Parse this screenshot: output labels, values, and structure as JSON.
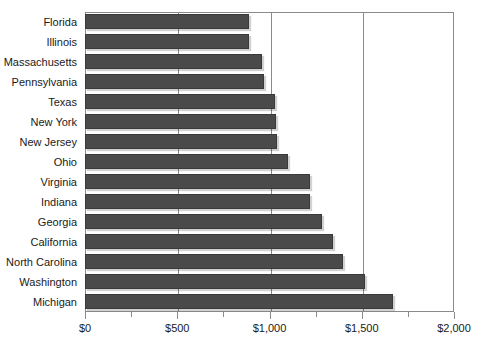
{
  "chart_data": {
    "type": "bar",
    "orientation": "horizontal",
    "title": "",
    "subtitle": "",
    "xlabel": "",
    "ylabel": "",
    "xlim": [
      0,
      2000
    ],
    "grid": true,
    "legend": null,
    "currency_prefix": "$",
    "categories": [
      "Florida",
      "Illinois",
      "Massachusetts",
      "Pennsylvania",
      "Texas",
      "New York",
      "New Jersey",
      "Ohio",
      "Virginia",
      "Indiana",
      "Georgia",
      "California",
      "North Carolina",
      "Washington",
      "Michigan"
    ],
    "values": [
      890,
      890,
      960,
      970,
      1030,
      1035,
      1040,
      1100,
      1220,
      1220,
      1285,
      1345,
      1400,
      1520,
      1670
    ],
    "xticks": [
      0,
      500,
      1000,
      1500,
      2000
    ],
    "xtick_labels": [
      "$0",
      "$500",
      "$1,000",
      "$1,500",
      "$2,000"
    ],
    "xminor_ticks": [
      250,
      750,
      1250,
      1750
    ],
    "gridlines": [
      500,
      1000,
      1500
    ],
    "bar_color": "#4a4a4a",
    "axis_color": "#8a8a8a",
    "background_color": "#ffffff"
  }
}
